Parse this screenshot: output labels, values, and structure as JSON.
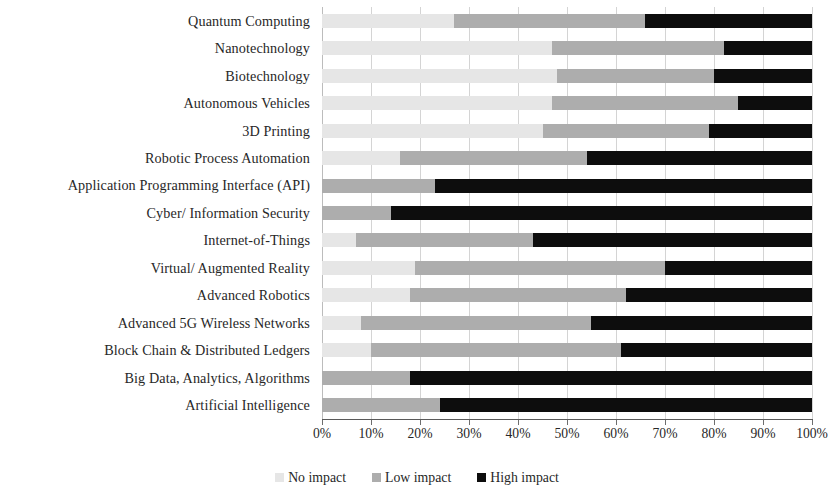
{
  "chart_data": {
    "type": "bar",
    "subtype": "stacked-horizontal-100-percent",
    "title": "",
    "xlabel": "",
    "ylabel": "",
    "xlim": [
      0,
      100
    ],
    "grid": true,
    "legend_position": "bottom-center",
    "x_ticks": [
      "0%",
      "10%",
      "20%",
      "30%",
      "40%",
      "50%",
      "60%",
      "70%",
      "80%",
      "90%",
      "100%"
    ],
    "x_tick_values": [
      0,
      10,
      20,
      30,
      40,
      50,
      60,
      70,
      80,
      90,
      100
    ],
    "categories": [
      "Quantum Computing",
      "Nanotechnology",
      "Biotechnology",
      "Autonomous Vehicles",
      "3D Printing",
      "Robotic Process Automation",
      "Application Programming Interface (API)",
      "Cyber/ Information Security",
      "Internet-of-Things",
      "Virtual/ Augmented Reality",
      "Advanced Robotics",
      "Advanced 5G Wireless Networks",
      "Block Chain & Distributed Ledgers",
      "Big Data, Analytics, Algorithms",
      "Artificial Intelligence"
    ],
    "series": [
      {
        "name": "No impact",
        "color": "#e6e6e6",
        "values": [
          27,
          47,
          48,
          47,
          45,
          16,
          0,
          0,
          7,
          19,
          18,
          8,
          10,
          0,
          0
        ]
      },
      {
        "name": "Low impact",
        "color": "#adadad",
        "values": [
          39,
          35,
          32,
          38,
          34,
          38,
          23,
          14,
          36,
          51,
          44,
          47,
          51,
          18,
          24
        ]
      },
      {
        "name": "High impact",
        "color": "#0d0d0d",
        "values": [
          34,
          18,
          20,
          15,
          21,
          46,
          77,
          86,
          57,
          30,
          38,
          45,
          39,
          82,
          76
        ]
      }
    ]
  },
  "legend": {
    "items": [
      {
        "label": "No impact",
        "color": "#e6e6e6"
      },
      {
        "label": "Low impact",
        "color": "#adadad"
      },
      {
        "label": "High impact",
        "color": "#0d0d0d"
      }
    ]
  }
}
